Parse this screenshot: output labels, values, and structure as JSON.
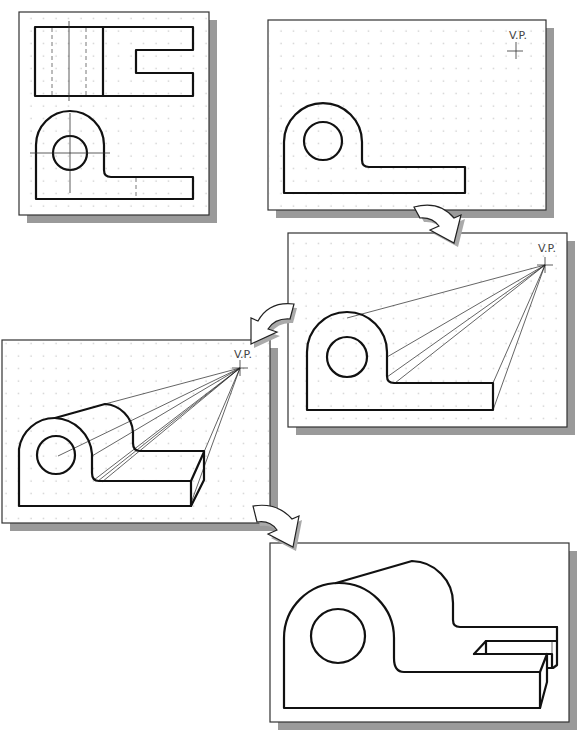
{
  "figure": {
    "panels": [
      {
        "id": "orthographic-views",
        "label": ""
      },
      {
        "id": "step-front-face-and-vp",
        "vp_label": "V.P."
      },
      {
        "id": "step-projection-lines",
        "vp_label": "V.P."
      },
      {
        "id": "step-depth-lines",
        "vp_label": "V.P."
      },
      {
        "id": "step-final-perspective",
        "vp_label": ""
      }
    ],
    "arrows": [
      "arrow-1-to-2",
      "arrow-2-to-3",
      "arrow-3-to-4",
      "arrow-4-to-5"
    ],
    "colors": {
      "line": "#111111",
      "grid_dot": "#9a9a9a",
      "shadow": "#9a9a9a",
      "background": "#ffffff"
    }
  }
}
